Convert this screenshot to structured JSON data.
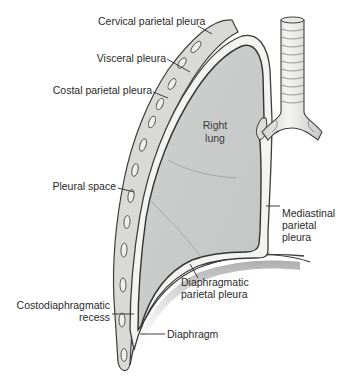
{
  "diagram": {
    "colors": {
      "background": "#ffffff",
      "lung_fill": "#c9cbca",
      "pleura_outline": "#3c3c3c",
      "pleural_space": "#f4f4f2",
      "chest_wall": "#d6d7d5",
      "trachea": "#e9e9e7",
      "diaphragm_shadow": "#8a8a8a",
      "text": "#2a2a2a"
    },
    "organ_label": {
      "line1": "Right",
      "line2": "lung"
    },
    "labels": {
      "cervical_parietal_pleura": "Cervical parietal pleura",
      "visceral_pleura": "Visceral pleura",
      "costal_parietal_pleura": "Costal parietal pleura",
      "pleural_space": "Pleural space",
      "mediastinal_parietal_pleura": {
        "line1": "Mediastinal",
        "line2": "parietal",
        "line3": "pleura"
      },
      "diaphragmatic_parietal_pleura": {
        "line1": "Diaphragmatic",
        "line2": "parietal pleura"
      },
      "costodiaphragmatic_recess": {
        "line1": "Costodiaphragmatic",
        "line2": "recess"
      },
      "diaphragm": "Diaphragm"
    }
  }
}
